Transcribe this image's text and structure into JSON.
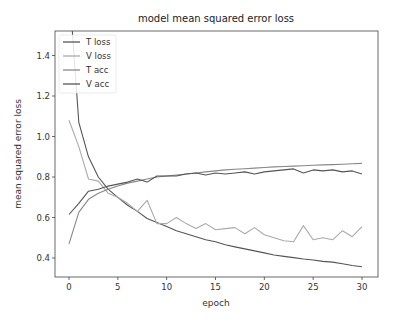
{
  "chart_data": {
    "type": "line",
    "title": "model mean squared error loss",
    "xlabel": "epoch",
    "ylabel": "mean squared error loss",
    "xlim": [
      -1.5,
      31.5
    ],
    "ylim": [
      0.306,
      1.52
    ],
    "xticks": [
      0,
      5,
      10,
      15,
      20,
      25,
      30
    ],
    "yticks": [
      0.4,
      0.6,
      0.8,
      1.0,
      1.2,
      1.4
    ],
    "ytick_labels": [
      "0.4",
      "0.6",
      "0.8",
      "1.0",
      "1.2",
      "1.4"
    ],
    "grid": false,
    "legend_position": "upper left",
    "x": [
      0,
      1,
      2,
      3,
      4,
      5,
      6,
      7,
      8,
      9,
      10,
      11,
      12,
      13,
      14,
      15,
      16,
      17,
      18,
      19,
      20,
      21,
      22,
      23,
      24,
      25,
      26,
      27,
      28,
      29,
      30
    ],
    "series": [
      {
        "name": "T loss",
        "color": "#555555",
        "values": [
          1.75,
          1.07,
          0.9,
          0.8,
          0.74,
          0.7,
          0.66,
          0.63,
          0.595,
          0.575,
          0.555,
          0.535,
          0.52,
          0.505,
          0.49,
          0.48,
          0.465,
          0.455,
          0.445,
          0.435,
          0.425,
          0.415,
          0.408,
          0.402,
          0.395,
          0.39,
          0.383,
          0.38,
          0.372,
          0.363,
          0.357
        ]
      },
      {
        "name": "V loss",
        "color": "#aaaaaa",
        "values": [
          1.08,
          0.95,
          0.79,
          0.78,
          0.72,
          0.7,
          0.67,
          0.63,
          0.685,
          0.57,
          0.57,
          0.6,
          0.57,
          0.545,
          0.57,
          0.54,
          0.545,
          0.55,
          0.52,
          0.55,
          0.515,
          0.5,
          0.485,
          0.48,
          0.56,
          0.49,
          0.5,
          0.49,
          0.535,
          0.505,
          0.555
        ]
      },
      {
        "name": "T acc",
        "color": "#888888",
        "values": [
          0.47,
          0.625,
          0.69,
          0.72,
          0.74,
          0.755,
          0.77,
          0.78,
          0.79,
          0.8,
          0.805,
          0.81,
          0.815,
          0.82,
          0.825,
          0.83,
          0.835,
          0.838,
          0.841,
          0.844,
          0.847,
          0.85,
          0.852,
          0.854,
          0.856,
          0.858,
          0.86,
          0.861,
          0.863,
          0.865,
          0.867
        ]
      },
      {
        "name": "V acc",
        "color": "#555555",
        "values": [
          0.615,
          0.67,
          0.73,
          0.74,
          0.755,
          0.765,
          0.775,
          0.79,
          0.775,
          0.805,
          0.805,
          0.805,
          0.815,
          0.82,
          0.81,
          0.82,
          0.815,
          0.82,
          0.825,
          0.815,
          0.825,
          0.83,
          0.835,
          0.84,
          0.82,
          0.835,
          0.83,
          0.835,
          0.825,
          0.83,
          0.815
        ]
      }
    ]
  },
  "labels": {
    "title": "model mean squared error loss",
    "xlabel": "epoch",
    "ylabel": "mean squared error loss"
  }
}
